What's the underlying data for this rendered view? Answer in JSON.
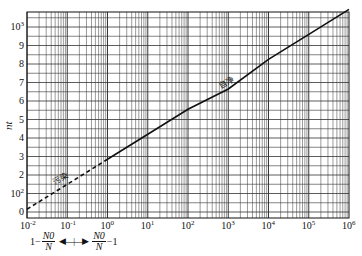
{
  "chart_data": {
    "type": "line",
    "title": "",
    "xlabel_left": "1 − N0/N",
    "xlabel_right": "N0/N − 1",
    "ylabel": "nt",
    "xscale": "log",
    "xlim": [
      0.01,
      1000000
    ],
    "ylim": [
      0,
      1100
    ],
    "grid": true,
    "x_tick_labels": [
      "10-2",
      "10-1",
      "100",
      "101",
      "102",
      "103",
      "104",
      "105",
      "106"
    ],
    "y_tick_labels": [
      "0",
      "10²",
      "2",
      "3",
      "4",
      "5",
      "6",
      "7",
      "8",
      "9",
      "10³"
    ],
    "y_tick_values": [
      0,
      100,
      200,
      300,
      400,
      500,
      600,
      700,
      800,
      900,
      1000
    ],
    "x": [
      0.01,
      0.1,
      1,
      10,
      100,
      1000,
      10000,
      100000,
      1000000
    ],
    "series": [
      {
        "name": "污染",
        "style": "dashed",
        "x": [
          0.01,
          0.1,
          1
        ],
        "values": [
          15,
          150,
          285
        ]
      },
      {
        "name": "自净",
        "style": "solid",
        "x": [
          1,
          10,
          100,
          1000,
          10000,
          100000,
          1000000
        ],
        "values": [
          285,
          420,
          555,
          665,
          825,
          960,
          1095
        ]
      }
    ],
    "annotations": [
      {
        "text": "污染",
        "near_x": 0.03
      },
      {
        "text": "自净",
        "near_x": 1000
      }
    ]
  },
  "labels": {
    "ylabel": "nt",
    "pollution": "污染",
    "self_purification": "自净",
    "formula_left_one": "1−",
    "formula_right_tail": "−1",
    "N0": "N0",
    "N": "N",
    "arrows": "◀—|—▶"
  },
  "x_ticks": [
    {
      "base": "10",
      "exp": "-2"
    },
    {
      "base": "10",
      "exp": "-1"
    },
    {
      "base": "10",
      "exp": "0"
    },
    {
      "base": "10",
      "exp": "1"
    },
    {
      "base": "10",
      "exp": "2"
    },
    {
      "base": "10",
      "exp": "3"
    },
    {
      "base": "10",
      "exp": "4"
    },
    {
      "base": "10",
      "exp": "5"
    },
    {
      "base": "10",
      "exp": "6"
    }
  ],
  "y_ticks": [
    {
      "text": "0",
      "exp": ""
    },
    {
      "text": "10",
      "exp": "2"
    },
    {
      "text": "2",
      "exp": ""
    },
    {
      "text": "3",
      "exp": ""
    },
    {
      "text": "4",
      "exp": ""
    },
    {
      "text": "5",
      "exp": ""
    },
    {
      "text": "6",
      "exp": ""
    },
    {
      "text": "7",
      "exp": ""
    },
    {
      "text": "8",
      "exp": ""
    },
    {
      "text": "9",
      "exp": ""
    },
    {
      "text": "10",
      "exp": "3"
    }
  ]
}
